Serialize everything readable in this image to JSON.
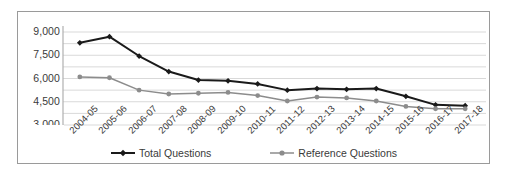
{
  "chart_data": {
    "type": "line",
    "title": "",
    "xlabel": "",
    "ylabel": "",
    "categories": [
      "2004-05",
      "2005-06",
      "2006-07",
      "2007-08",
      "2008-09",
      "2009-10",
      "2010-11",
      "2011-12",
      "2012-13",
      "2013-14",
      "2014-15",
      "2015-16",
      "2016-17",
      "2017-18"
    ],
    "series": [
      {
        "name": "Total Questions",
        "color": "#1a1a1a",
        "marker": "diamond",
        "values": [
          8300,
          8700,
          7450,
          6450,
          5900,
          5850,
          5650,
          5250,
          5350,
          5300,
          5350,
          4850,
          4300,
          4250
        ]
      },
      {
        "name": "Reference Questions",
        "color": "#8c8c8c",
        "marker": "circle",
        "values": [
          6100,
          6050,
          5250,
          5000,
          5050,
          5100,
          4900,
          4550,
          4800,
          4750,
          4550,
          4200,
          4050,
          4050
        ]
      }
    ],
    "ylim": [
      3000,
      9000
    ],
    "yticks": [
      3000,
      4500,
      6000,
      7500,
      9000
    ],
    "ytick_labels": [
      "3,000",
      "4,500",
      "6,000",
      "7,500",
      "9,000"
    ],
    "gridlines": [
      3000,
      3750,
      4500,
      5250,
      6000,
      6750,
      7500,
      8250,
      9000
    ],
    "grid": true,
    "grid_color": "#d9d9d9",
    "legend_position": "bottom",
    "plot_background": "#ffffff",
    "border_color": "#9a9a9a"
  }
}
